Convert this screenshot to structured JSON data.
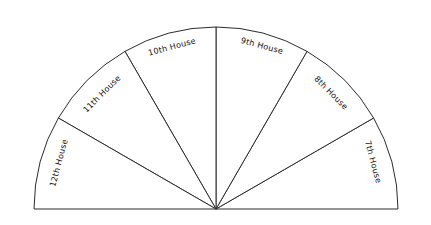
{
  "figure": {
    "background_color": "#ffffff",
    "line_color": "#2b2b2b",
    "text_color": "#111111"
  },
  "chart_data": {
    "type": "pie",
    "title": "",
    "subtitle": "",
    "xlabel": "",
    "ylabel": "",
    "legend_position": "none",
    "grid": false,
    "shape": "semicircle",
    "center_x": 216,
    "center_y": 209,
    "radius": 182,
    "total_span_degrees": 180,
    "sector_count": 6,
    "sector_span_degrees": 30,
    "angle_start_degrees": 0,
    "angle_end_degrees": 180,
    "categories": [
      "7th House",
      "8th House",
      "9th House",
      "10th House",
      "11th House",
      "12th House"
    ],
    "values": [
      30,
      30,
      30,
      30,
      30,
      30
    ],
    "sectors": [
      {
        "label": "7th House",
        "start_deg": 0,
        "end_deg": 30,
        "mid_deg": 15,
        "label_rotation_deg": 75,
        "label_x": 373,
        "label_y": 162
      },
      {
        "label": "8th House",
        "start_deg": 30,
        "end_deg": 60,
        "mid_deg": 45,
        "label_rotation_deg": 45,
        "label_x": 331,
        "label_y": 93
      },
      {
        "label": "9th House",
        "start_deg": 60,
        "end_deg": 90,
        "mid_deg": 75,
        "label_rotation_deg": 15,
        "label_x": 262,
        "label_y": 46
      },
      {
        "label": "10th House",
        "start_deg": 90,
        "end_deg": 120,
        "mid_deg": 105,
        "label_rotation_deg": -15,
        "label_x": 172,
        "label_y": 47
      },
      {
        "label": "11th House",
        "start_deg": 120,
        "end_deg": 150,
        "mid_deg": 135,
        "label_rotation_deg": -45,
        "label_x": 102,
        "label_y": 94
      },
      {
        "label": "12th House",
        "start_deg": 150,
        "end_deg": 180,
        "mid_deg": 165,
        "label_rotation_deg": -75,
        "label_x": 59,
        "label_y": 163
      }
    ]
  }
}
